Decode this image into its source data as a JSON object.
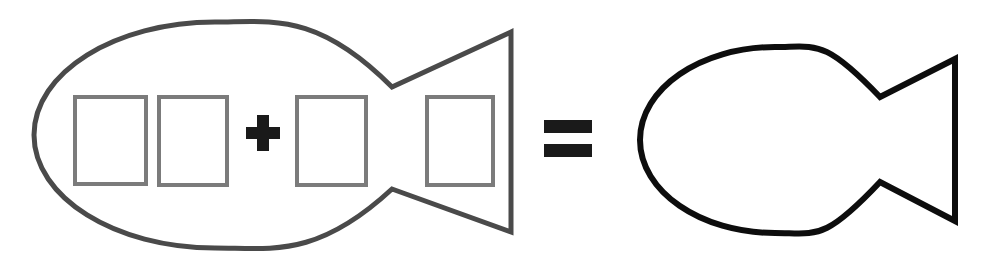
{
  "canvas": {
    "width": 983,
    "height": 271,
    "background_color": "#ffffff"
  },
  "equation": {
    "description": "Fish outline containing four empty rectangular slots separated by a plus sign, equals a plain fish outline",
    "plus_symbol": "+",
    "equals_symbol": "=",
    "left_term_label": "fish with four empty slots and plus operator",
    "right_term_label": "plain fish outline"
  },
  "colors": {
    "left_fish_stroke": "#4a4a4a",
    "right_fish_stroke": "#0d0d0d",
    "slot_border": "#7b7b7b",
    "slot_fill": "#ffffff",
    "operator": "#1a1a1a",
    "page_background": "#ffffff"
  },
  "left_fish": {
    "name": "left-fish-shape",
    "stroke_width": 5,
    "body": {
      "cx": 215,
      "cy": 135,
      "rx": 181,
      "ry": 113
    },
    "notch": {
      "x": 392,
      "top_y": 87,
      "bottom_y": 189
    },
    "tail": {
      "right_x": 511,
      "top_y": 32,
      "bottom_y": 232
    }
  },
  "right_fish": {
    "name": "right-fish-shape",
    "stroke_width": 6,
    "body": {
      "cx": 775,
      "cy": 140,
      "rx": 135,
      "ry": 93
    },
    "notch": {
      "x": 880,
      "top_y": 97,
      "bottom_y": 182
    },
    "tail": {
      "right_x": 955,
      "top_y": 59,
      "bottom_y": 221
    }
  },
  "slots": [
    {
      "name": "slot-1",
      "x": 73,
      "y": 95,
      "width": 75,
      "height": 91,
      "border_width": 4,
      "value": ""
    },
    {
      "name": "slot-2",
      "x": 157,
      "y": 95,
      "width": 72,
      "height": 92,
      "border_width": 4,
      "value": ""
    },
    {
      "name": "slot-3",
      "x": 295,
      "y": 95,
      "width": 73,
      "height": 92,
      "border_width": 4,
      "value": ""
    },
    {
      "name": "slot-4",
      "x": 425,
      "y": 95,
      "width": 70,
      "height": 92,
      "border_width": 4,
      "value": ""
    }
  ],
  "plus_sign": {
    "name": "plus-sign",
    "x": 246,
    "y": 115,
    "width": 34,
    "height": 36,
    "bar_thickness": 12
  },
  "equals_sign": {
    "name": "equals-sign",
    "x": 544,
    "width": 48,
    "bar_height": 13,
    "top_bar_y": 120,
    "bottom_bar_y": 144
  }
}
